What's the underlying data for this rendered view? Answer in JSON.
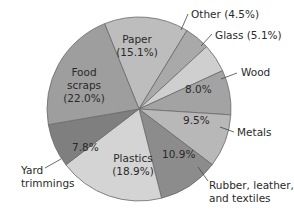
{
  "chart_data": {
    "type": "pie",
    "title": "",
    "slices": [
      {
        "label": "Paper",
        "value": 15.1,
        "color": "#bdbdbd"
      },
      {
        "label": "Other",
        "value": 4.5,
        "color": "#a9a9a9"
      },
      {
        "label": "Glass",
        "value": 5.1,
        "color": "#cfcfcf"
      },
      {
        "label": "Wood",
        "value": 8.0,
        "color": "#a3a3a3"
      },
      {
        "label": "Metals",
        "value": 9.5,
        "color": "#b8b8b8"
      },
      {
        "label": "Rubber, leather, and textiles",
        "value": 10.9,
        "color": "#8c8c8c"
      },
      {
        "label": "Plastics",
        "value": 18.9,
        "color": "#d4d4d4"
      },
      {
        "label": "Yard trimmings",
        "value": 7.8,
        "color": "#7f7f7f"
      },
      {
        "label": "Food scraps",
        "value": 22.0,
        "color": "#9e9e9e"
      }
    ],
    "unit": "%"
  },
  "labels": {
    "paper": [
      "Paper",
      "(15.1%)"
    ],
    "other": "Other (4.5%)",
    "glass": "Glass (5.1%)",
    "wood_name": "Wood",
    "wood_value": "8.0%",
    "metals_name": "Metals",
    "metals_value": "9.5%",
    "rubber_name": [
      "Rubber, leather,",
      "and textiles"
    ],
    "rubber_value": "10.9%",
    "plastics": [
      "Plastics",
      "(18.9%)"
    ],
    "yard_name": [
      "Yard",
      "trimmings"
    ],
    "yard_value": "7.8%",
    "food": [
      "Food",
      "scraps",
      "(22.0%)"
    ]
  }
}
